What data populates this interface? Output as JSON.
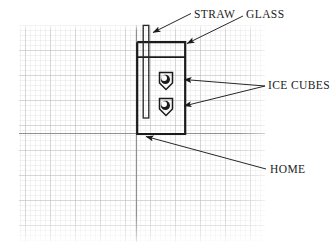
{
  "figure": {
    "medium": "graph-paper-diagram",
    "background_color": "#ffffff",
    "grid": {
      "minor_color": "#d8d8d8",
      "major_color": "#b6b6b6",
      "axis_color": "#8f8f8f",
      "minor_spacing_px": 5,
      "major_every_n_cells": 5,
      "left_px": 19,
      "top_px": 25,
      "right_px": 265,
      "bottom_px": 242,
      "axis_horizontal_y_px": 133,
      "axis_vertical_x_px": 136
    },
    "ink_color": "#1b1b1b"
  },
  "labels": [
    {
      "id": "straw",
      "text": "STRAW",
      "points_to": "straw-top",
      "arrow_from": [
        191,
        14
      ],
      "arrow_to": [
        152,
        33
      ]
    },
    {
      "id": "glass",
      "text": "GLASS",
      "points_to": "glass-top-right-corner",
      "arrow_from": [
        244,
        16
      ],
      "arrow_to": [
        186,
        43
      ]
    },
    {
      "id": "ice_cubes",
      "text": "ICE CUBES",
      "points_to": "ice-cubes",
      "arrow_from": [
        265,
        86
      ],
      "arrow_to": [
        184,
        85
      ]
    },
    {
      "id": "home",
      "text": "HOME",
      "points_to": "glass-bottom-left-origin",
      "arrow_from": [
        267,
        170
      ],
      "arrow_to": [
        145,
        136
      ]
    }
  ],
  "objects": {
    "glass": {
      "name": "glass",
      "left_px": 137,
      "top_px": 42,
      "right_px": 185,
      "bottom_px": 134,
      "stroke_width": 2.1
    },
    "water_line": {
      "name": "water-level-line",
      "y_px": 57,
      "left_px": 137,
      "right_px": 185,
      "stroke_width": 1.6
    },
    "straw": {
      "name": "straw",
      "left_px": 143,
      "right_px": 149,
      "top_px": 25,
      "bottom_px": 118,
      "stroke_width": 1.4
    },
    "ice_cubes": [
      {
        "name": "ice-cube-upper",
        "cx_px": 166,
        "cy_px": 80,
        "size_px": 16
      },
      {
        "name": "ice-cube-lower",
        "cx_px": 166,
        "cy_px": 106,
        "size_px": 16
      }
    ]
  }
}
